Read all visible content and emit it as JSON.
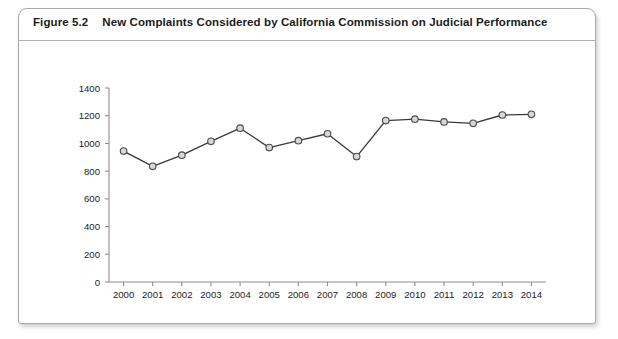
{
  "figure": {
    "number": "Figure 5.2",
    "caption": "New Complaints Considered by California Commission on Judicial Performance"
  },
  "chart_data": {
    "type": "line",
    "title": "New Complaints Considered by California Commission on Judicial Performance",
    "xlabel": "",
    "ylabel": "",
    "categories": [
      "2000",
      "2001",
      "2002",
      "2003",
      "2004",
      "2005",
      "2006",
      "2007",
      "2008",
      "2009",
      "2010",
      "2011",
      "2012",
      "2013",
      "2014"
    ],
    "values": [
      945,
      835,
      915,
      1015,
      1110,
      970,
      1020,
      1070,
      905,
      1165,
      1175,
      1155,
      1145,
      1205,
      1210
    ],
    "series": [
      {
        "name": "New Complaints Considered",
        "values": [
          945,
          835,
          915,
          1015,
          1110,
          970,
          1020,
          1070,
          905,
          1165,
          1175,
          1155,
          1145,
          1205,
          1210
        ]
      }
    ],
    "ylim": [
      0,
      1400
    ],
    "y_ticks": [
      0,
      200,
      400,
      600,
      800,
      1000,
      1200,
      1400
    ],
    "y_tick_labels": [
      "0",
      "200",
      "400",
      "600",
      "800",
      "1000",
      "1200",
      "1400"
    ],
    "x_tick_labels": [
      "2000",
      "2001",
      "2002",
      "2003",
      "2004",
      "2005",
      "2006",
      "2007",
      "2008",
      "2009",
      "2010",
      "2011",
      "2012",
      "2013",
      "2014"
    ],
    "grid": false,
    "legend": false,
    "marker": "circle",
    "line_color": "#3a3a3a",
    "marker_fill": "#d7d7d7",
    "marker_stroke": "#4a4a4a",
    "axis_color": "#8e8e8e"
  }
}
